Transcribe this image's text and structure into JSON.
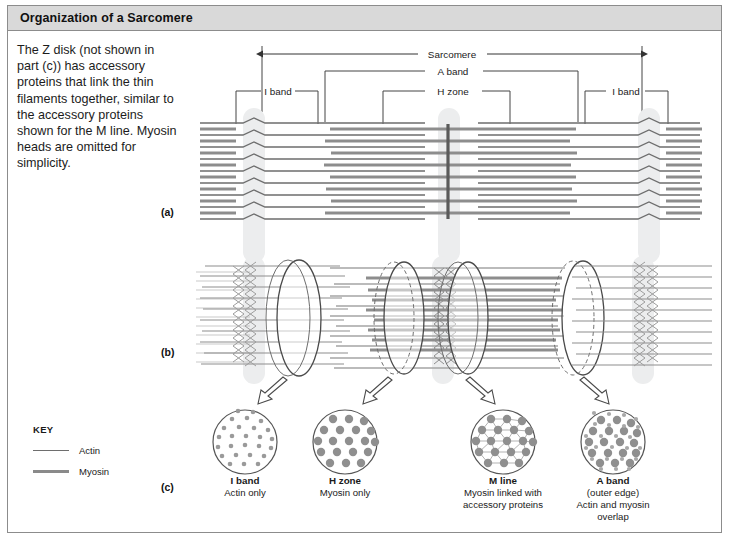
{
  "figure": {
    "title": "Organization of a Sarcomere",
    "caption": "The Z disk (not shown in part (c)) has accessory proteins that link the thin filaments together, similar to the accessory proteins shown for the M line. Myosin heads are omitted for simplicity."
  },
  "panels": {
    "a": "(a)",
    "b": "(b)",
    "c": "(c)"
  },
  "brackets": {
    "sarcomere": "Sarcomere",
    "a_band": "A band",
    "h_zone": "H zone",
    "i_band_left": "I band",
    "i_band_right": "I  band"
  },
  "structure_labels": {
    "z_disk_left": "Z disk",
    "z_disk_right": "Z disk",
    "m_line": "M line"
  },
  "key": {
    "title": "KEY",
    "items": [
      {
        "name": "Actin",
        "color": "#6e6e6e",
        "thickness": "thin"
      },
      {
        "name": "Myosin",
        "color": "#8a8a8a",
        "thickness": "thick"
      }
    ]
  },
  "cross_sections": [
    {
      "id": "i-band",
      "title": "I band",
      "subtitle": "Actin only",
      "subtitle2": "",
      "subtitle3": "",
      "contents": "small actin dots only"
    },
    {
      "id": "h-zone",
      "title": "H zone",
      "subtitle": "Myosin only",
      "subtitle2": "",
      "subtitle3": "",
      "contents": "large myosin dots only"
    },
    {
      "id": "m-line",
      "title": "M line",
      "subtitle": "Myosin linked with",
      "subtitle2": "accessory proteins",
      "subtitle3": "",
      "contents": "myosin dots joined by accessory protein links"
    },
    {
      "id": "a-band",
      "title": "A band",
      "subtitle": "(outer edge)",
      "subtitle2": "Actin and myosin",
      "subtitle3": "overlap",
      "contents": "large myosin dots surrounded by small actin dots"
    }
  ],
  "colors": {
    "frame_border": "#8c8c8c",
    "title_band": "#d9d9d9",
    "actin": "#6e6e6e",
    "myosin": "#8a8a8a",
    "z_disk_fill": "#eceded",
    "m_line": "#5a5a5a",
    "dot_fill": "#9a9a9a",
    "background": "#ffffff"
  }
}
